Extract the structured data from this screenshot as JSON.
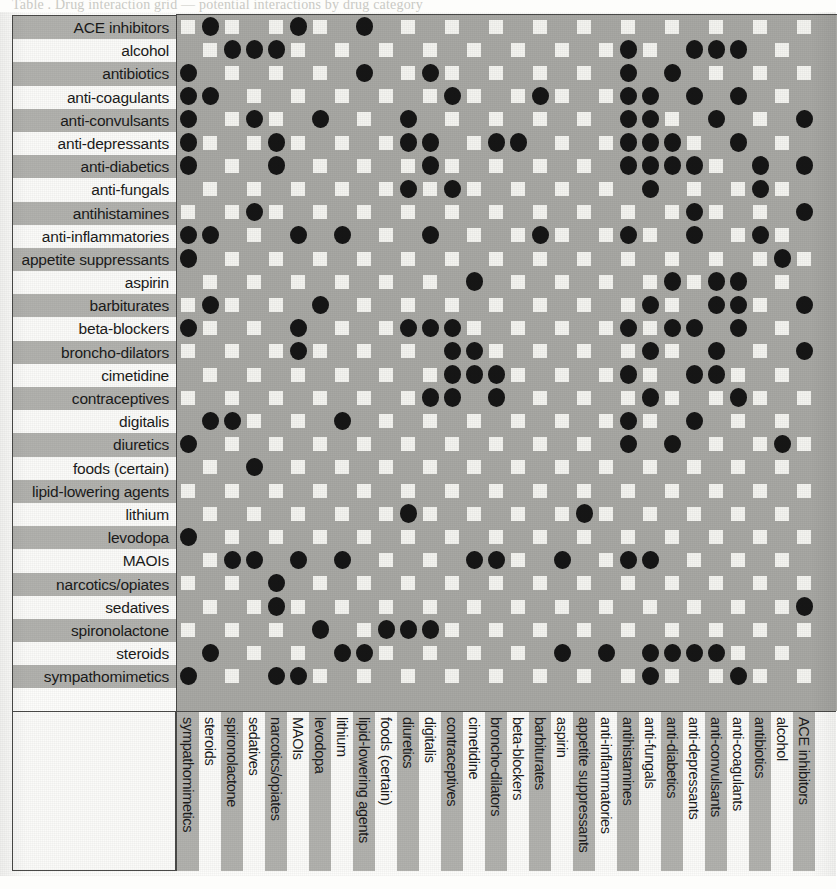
{
  "caption": {
    "cut_off_line": "Table  .  Drug interaction grid — potential interactions by drug category"
  },
  "chart_data": {
    "type": "heatmap",
    "title": "",
    "xlabel": "",
    "ylabel": "",
    "grid": true,
    "legend_position": "none",
    "marker": "filled-circle",
    "marker_color": "#161616",
    "cell_empty_color": "#f4f4f0",
    "background_color": "#a8a8a4",
    "row_band_dark": "#b2b2ae",
    "row_band_light": "#fbfbf9",
    "row_categories": [
      "ACE inhibitors",
      "alcohol",
      "antibiotics",
      "anti-coagulants",
      "anti-convulsants",
      "anti-depressants",
      "anti-diabetics",
      "anti-fungals",
      "antihistamines",
      "anti-inflammatories",
      "appetite suppressants",
      "aspirin",
      "barbiturates",
      "beta-blockers",
      "broncho-dilators",
      "cimetidine",
      "contraceptives",
      "digitalis",
      "diuretics",
      "foods (certain)",
      "lipid-lowering agents",
      "lithium",
      "levodopa",
      "MAOIs",
      "narcotics/opiates",
      "sedatives",
      "spironolactone",
      "steroids",
      "sympathomimetics"
    ],
    "column_categories": [
      "sympathomimetics",
      "steroids",
      "spironolactone",
      "sedatives",
      "narcotics/opiates",
      "MAOIs",
      "levodopa",
      "lithium",
      "lipid-lowering agents",
      "foods (certain)",
      "diuretics",
      "digitalis",
      "contraceptives",
      "cimetidine",
      "broncho-dilators",
      "beta-blockers",
      "barbiturates",
      "aspirin",
      "appetite suppressants",
      "anti-inflammatories",
      "antihistamines",
      "anti-fungals",
      "anti-diabetics",
      "anti-depressants",
      "anti-convulsants",
      "anti-coagulants",
      "antibiotics",
      "alcohol",
      "ACE inhibitors"
    ],
    "matrix_note": "Matrix cells are given as 30 rows x 30 columns of 0/1; 1 = interaction dot present.",
    "matrix": [
      [
        0,
        1,
        0,
        0,
        0,
        1,
        0,
        0,
        1,
        0,
        0,
        0,
        0,
        0,
        0,
        0,
        0,
        0,
        0,
        0,
        0,
        0,
        0,
        0,
        0,
        0,
        0,
        0,
        0,
        0
      ],
      [
        0,
        0,
        1,
        1,
        1,
        0,
        0,
        0,
        0,
        0,
        0,
        0,
        0,
        0,
        0,
        0,
        0,
        0,
        0,
        0,
        1,
        0,
        0,
        1,
        1,
        1,
        0,
        0,
        0,
        0
      ],
      [
        1,
        0,
        0,
        0,
        0,
        0,
        0,
        0,
        1,
        0,
        0,
        1,
        0,
        0,
        0,
        0,
        0,
        0,
        0,
        0,
        1,
        0,
        1,
        0,
        0,
        0,
        0,
        0,
        0,
        0
      ],
      [
        1,
        1,
        0,
        0,
        0,
        0,
        0,
        0,
        0,
        0,
        0,
        0,
        1,
        0,
        0,
        0,
        1,
        0,
        0,
        0,
        1,
        1,
        0,
        1,
        0,
        1,
        0,
        0,
        0,
        1
      ],
      [
        1,
        0,
        0,
        1,
        0,
        0,
        1,
        0,
        0,
        0,
        1,
        0,
        0,
        0,
        0,
        0,
        0,
        0,
        0,
        0,
        1,
        1,
        0,
        0,
        1,
        0,
        0,
        0,
        1,
        0
      ],
      [
        1,
        0,
        0,
        0,
        1,
        0,
        0,
        0,
        0,
        0,
        1,
        1,
        0,
        0,
        1,
        1,
        0,
        0,
        0,
        0,
        1,
        1,
        1,
        0,
        0,
        1,
        0,
        0,
        0,
        1
      ],
      [
        1,
        0,
        0,
        0,
        1,
        0,
        0,
        0,
        0,
        0,
        0,
        1,
        0,
        0,
        0,
        0,
        0,
        0,
        0,
        0,
        1,
        1,
        1,
        1,
        0,
        0,
        1,
        0,
        1,
        0
      ],
      [
        0,
        0,
        0,
        0,
        0,
        0,
        0,
        0,
        0,
        0,
        1,
        0,
        1,
        0,
        0,
        0,
        0,
        0,
        0,
        0,
        0,
        1,
        0,
        0,
        0,
        0,
        1,
        0,
        0,
        0
      ],
      [
        0,
        0,
        0,
        1,
        0,
        0,
        0,
        0,
        0,
        0,
        0,
        0,
        0,
        0,
        0,
        0,
        0,
        0,
        0,
        0,
        0,
        0,
        0,
        1,
        0,
        0,
        0,
        0,
        1,
        0
      ],
      [
        1,
        1,
        0,
        0,
        0,
        1,
        0,
        1,
        0,
        0,
        0,
        1,
        0,
        0,
        0,
        0,
        1,
        0,
        0,
        0,
        1,
        0,
        0,
        1,
        0,
        0,
        1,
        0,
        0,
        1
      ],
      [
        1,
        0,
        0,
        0,
        0,
        0,
        0,
        0,
        0,
        0,
        0,
        0,
        0,
        0,
        0,
        0,
        0,
        0,
        0,
        0,
        0,
        0,
        0,
        0,
        0,
        0,
        0,
        1,
        0,
        0
      ],
      [
        0,
        0,
        0,
        0,
        0,
        0,
        0,
        0,
        0,
        0,
        0,
        0,
        0,
        1,
        0,
        0,
        0,
        0,
        0,
        0,
        0,
        0,
        1,
        0,
        1,
        1,
        0,
        0,
        0,
        0
      ],
      [
        0,
        1,
        0,
        0,
        0,
        0,
        1,
        0,
        0,
        0,
        0,
        0,
        0,
        0,
        0,
        0,
        0,
        0,
        0,
        0,
        0,
        1,
        0,
        0,
        1,
        1,
        0,
        0,
        1,
        0
      ],
      [
        1,
        0,
        0,
        0,
        0,
        1,
        0,
        0,
        0,
        0,
        1,
        1,
        1,
        0,
        0,
        0,
        0,
        0,
        0,
        0,
        1,
        0,
        1,
        1,
        0,
        1,
        0,
        0,
        0,
        0
      ],
      [
        0,
        0,
        0,
        0,
        0,
        1,
        0,
        0,
        0,
        0,
        0,
        0,
        1,
        1,
        0,
        0,
        0,
        0,
        0,
        0,
        0,
        1,
        0,
        0,
        1,
        0,
        0,
        0,
        1,
        0
      ],
      [
        0,
        0,
        0,
        0,
        0,
        0,
        0,
        0,
        0,
        0,
        0,
        0,
        1,
        1,
        1,
        0,
        0,
        0,
        0,
        0,
        1,
        0,
        0,
        1,
        1,
        0,
        0,
        0,
        0,
        0
      ],
      [
        0,
        0,
        0,
        0,
        0,
        0,
        0,
        0,
        0,
        0,
        0,
        1,
        1,
        0,
        1,
        0,
        0,
        0,
        0,
        0,
        0,
        1,
        0,
        0,
        0,
        1,
        0,
        0,
        0,
        0
      ],
      [
        0,
        1,
        1,
        0,
        0,
        0,
        0,
        1,
        0,
        0,
        0,
        0,
        0,
        0,
        0,
        0,
        0,
        0,
        0,
        0,
        1,
        0,
        0,
        1,
        0,
        0,
        0,
        0,
        0,
        0
      ],
      [
        1,
        0,
        0,
        0,
        0,
        0,
        0,
        0,
        0,
        0,
        0,
        0,
        0,
        0,
        0,
        0,
        0,
        0,
        0,
        0,
        1,
        0,
        1,
        0,
        0,
        0,
        0,
        1,
        0,
        1
      ],
      [
        0,
        0,
        0,
        1,
        0,
        0,
        0,
        0,
        0,
        0,
        0,
        0,
        0,
        0,
        0,
        0,
        0,
        0,
        0,
        0,
        0,
        0,
        0,
        0,
        0,
        0,
        0,
        0,
        0,
        0
      ],
      [
        0,
        0,
        0,
        0,
        0,
        0,
        0,
        0,
        0,
        0,
        0,
        0,
        0,
        0,
        0,
        0,
        0,
        0,
        0,
        0,
        0,
        0,
        0,
        0,
        0,
        0,
        0,
        0,
        0,
        0
      ],
      [
        0,
        0,
        0,
        0,
        0,
        0,
        0,
        0,
        0,
        0,
        1,
        0,
        0,
        0,
        0,
        0,
        0,
        0,
        1,
        0,
        0,
        0,
        0,
        0,
        0,
        0,
        0,
        0,
        0,
        1
      ],
      [
        1,
        0,
        0,
        0,
        0,
        0,
        0,
        0,
        0,
        0,
        0,
        0,
        0,
        0,
        0,
        0,
        0,
        0,
        0,
        0,
        0,
        0,
        0,
        0,
        0,
        0,
        0,
        0,
        0,
        0
      ],
      [
        0,
        0,
        1,
        1,
        0,
        1,
        0,
        1,
        0,
        0,
        0,
        0,
        0,
        1,
        1,
        0,
        0,
        1,
        0,
        0,
        1,
        1,
        0,
        0,
        0,
        0,
        0,
        0,
        0,
        0
      ],
      [
        0,
        0,
        0,
        0,
        1,
        0,
        0,
        0,
        0,
        0,
        0,
        0,
        0,
        0,
        0,
        0,
        0,
        0,
        0,
        0,
        0,
        0,
        0,
        0,
        0,
        0,
        0,
        0,
        0,
        0
      ],
      [
        0,
        0,
        0,
        0,
        1,
        0,
        0,
        0,
        0,
        0,
        0,
        0,
        0,
        0,
        0,
        0,
        0,
        0,
        0,
        0,
        0,
        0,
        0,
        0,
        0,
        0,
        0,
        0,
        1,
        0
      ],
      [
        0,
        0,
        0,
        0,
        0,
        0,
        1,
        0,
        0,
        1,
        1,
        1,
        0,
        0,
        0,
        0,
        0,
        0,
        0,
        0,
        0,
        0,
        0,
        0,
        0,
        0,
        0,
        0,
        0,
        1
      ],
      [
        0,
        1,
        0,
        0,
        0,
        0,
        0,
        1,
        1,
        0,
        0,
        0,
        0,
        0,
        0,
        0,
        0,
        1,
        0,
        1,
        0,
        1,
        1,
        1,
        1,
        0,
        0,
        0,
        0,
        0
      ],
      [
        1,
        0,
        0,
        0,
        1,
        1,
        0,
        0,
        0,
        0,
        0,
        0,
        0,
        0,
        0,
        0,
        0,
        0,
        0,
        0,
        0,
        1,
        0,
        0,
        0,
        1,
        0,
        0,
        0,
        0
      ],
      [
        0,
        0,
        0,
        0,
        0,
        0,
        0,
        0,
        0,
        0,
        0,
        0,
        0,
        0,
        0,
        0,
        0,
        0,
        0,
        0,
        0,
        0,
        0,
        0,
        0,
        0,
        0,
        0,
        0,
        0
      ]
    ]
  }
}
